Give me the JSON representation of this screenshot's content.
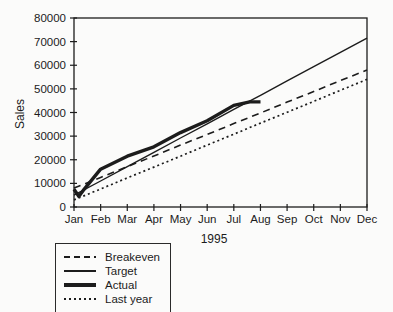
{
  "page": {
    "ink": "#1c1c1c",
    "background": "#fbfbfa"
  },
  "chart_data": {
    "type": "line",
    "title": "",
    "xlabel": "1995",
    "ylabel": "Sales",
    "ylim": [
      0,
      80000
    ],
    "grid": false,
    "legend_position": "bottom-left",
    "y_tick_labels": [
      "0",
      "10000",
      "20000",
      "30000",
      "40000",
      "50000",
      "60000",
      "70000",
      "80000"
    ],
    "months": [
      "Jan",
      "Feb",
      "Mar",
      "Apr",
      "May",
      "Jun",
      "Jul",
      "Aug",
      "Sep",
      "Oct",
      "Nov",
      "Dec"
    ],
    "series": [
      {
        "name": "Breakeven",
        "style": "dashed",
        "values": [
          8000,
          12500,
          17100,
          21600,
          26200,
          30700,
          35300,
          39800,
          44400,
          48900,
          53500,
          58000
        ]
      },
      {
        "name": "Target",
        "style": "solid",
        "values": [
          5000,
          11000,
          17100,
          23100,
          29200,
          35200,
          41300,
          47300,
          53400,
          59400,
          65500,
          71500
        ]
      },
      {
        "name": "Actual",
        "style": "solid-thick",
        "x": [
          0,
          0.18,
          0.38,
          1,
          2,
          3,
          4,
          5,
          6,
          6.6,
          7
        ],
        "values": [
          7500,
          4500,
          7500,
          16000,
          21500,
          25500,
          31500,
          36500,
          43000,
          44500,
          44500
        ]
      },
      {
        "name": "Last year",
        "style": "dotted",
        "values": [
          3000,
          7600,
          12300,
          16900,
          21500,
          26200,
          30800,
          35500,
          40100,
          44700,
          49400,
          54000
        ]
      }
    ]
  }
}
